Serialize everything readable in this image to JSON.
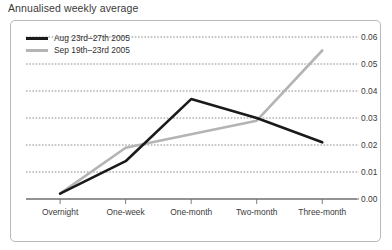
{
  "chart_title": "Annualised weekly average",
  "legend": [
    {
      "label": "Aug 23rd–27th 2005",
      "color": "#1a1a1a"
    },
    {
      "label": "Sep 19th–23rd 2005",
      "color": "#b4b4b4"
    }
  ],
  "axis": {
    "x_labels": [
      "Overnight",
      "One-week",
      "One-month",
      "Two-month",
      "Three-month"
    ],
    "y_labels": [
      "0.00",
      "0.01",
      "0.02",
      "0.03",
      "0.04",
      "0.05",
      "0.06"
    ]
  },
  "chart_data": {
    "type": "line",
    "title": "Annualised weekly average",
    "xlabel": "",
    "ylabel": "",
    "categories": [
      "Overnight",
      "One-week",
      "One-month",
      "Two-month",
      "Three-month"
    ],
    "series": [
      {
        "name": "Aug 23rd–27th 2005",
        "color": "#1a1a1a",
        "values": [
          0.002,
          0.014,
          0.037,
          0.03,
          0.021
        ]
      },
      {
        "name": "Sep 19th–23rd 2005",
        "color": "#b4b4b4",
        "values": [
          0.002,
          0.019,
          0.024,
          0.029,
          0.055
        ]
      }
    ],
    "ylim": [
      0.0,
      0.06
    ],
    "yticks": [
      0.0,
      0.01,
      0.02,
      0.03,
      0.04,
      0.05,
      0.06
    ],
    "ytick_labels": [
      "0.00",
      "0.01",
      "0.02",
      "0.03",
      "0.04",
      "0.05",
      "0.06"
    ],
    "y_axis_position": "right",
    "grid": true,
    "grid_style": "dotted",
    "legend_position": "top-left"
  }
}
